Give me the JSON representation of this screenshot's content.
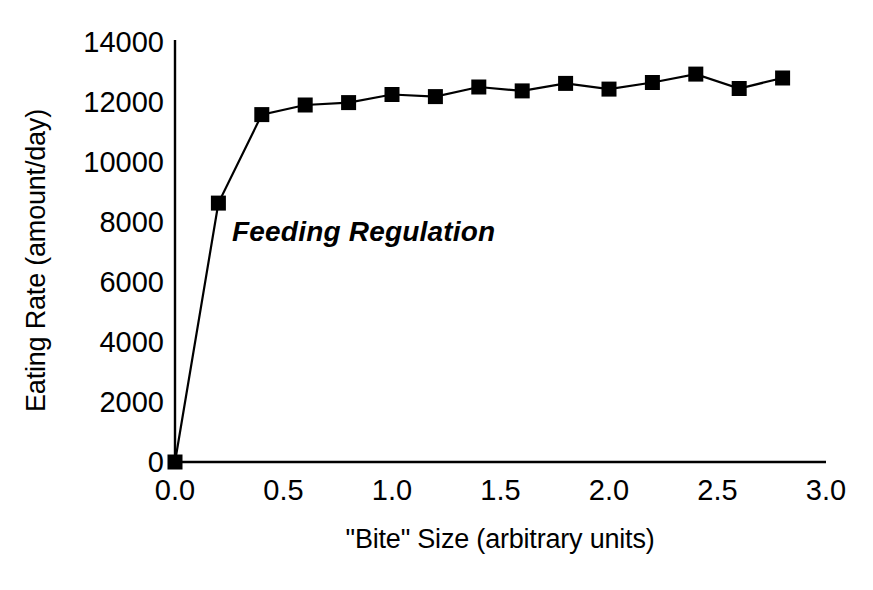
{
  "chart_data": {
    "type": "line",
    "title": "Feeding Regulation",
    "xlabel": "\"Bite\" Size (arbitrary units)",
    "ylabel": "Eating Rate (amount/day)",
    "grid": false,
    "legend": "none",
    "xlim": [
      0.0,
      3.0
    ],
    "ylim": [
      0,
      14000
    ],
    "xticks": [
      "0.0",
      "0.5",
      "1.0",
      "1.5",
      "2.0",
      "2.5",
      "3.0"
    ],
    "xtick_values": [
      0.0,
      0.5,
      1.0,
      1.5,
      2.0,
      2.5,
      3.0
    ],
    "yticks": [
      "0",
      "2000",
      "4000",
      "6000",
      "8000",
      "10000",
      "12000",
      "14000"
    ],
    "ytick_values": [
      0,
      2000,
      4000,
      6000,
      8000,
      10000,
      12000,
      14000
    ],
    "marker": "square",
    "marker_color": "#000000",
    "line_color": "#000000",
    "x": [
      0.0,
      0.2,
      0.4,
      0.6,
      0.8,
      1.0,
      1.2,
      1.4,
      1.6,
      1.8,
      2.0,
      2.2,
      2.4,
      2.6,
      2.8
    ],
    "values": [
      0,
      8630,
      11580,
      11900,
      11980,
      12250,
      12180,
      12500,
      12370,
      12620,
      12430,
      12650,
      12930,
      12450,
      12800
    ]
  }
}
